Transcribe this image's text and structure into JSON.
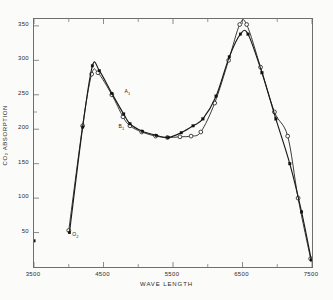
{
  "figure": {
    "background_color": "#fbfbf9",
    "frame_color": "#6e6e6e",
    "ink_color": "#1a1a1a"
  },
  "axis": {
    "y_title": "CO₂ ABSORPTION",
    "x_title": "WAVE LENGTH",
    "y_ticks": [
      350,
      300,
      250,
      200,
      150,
      100,
      50
    ],
    "x_ticks": [
      3500,
      4500,
      5500,
      6500,
      7500
    ],
    "x_minor_ticks": [
      4000,
      5000,
      6000,
      7000
    ],
    "y_minor_ticks": [
      225
    ]
  },
  "annotations": [
    {
      "name": "series-a-label",
      "text": "A",
      "sub": "1"
    },
    {
      "name": "series-b-label",
      "text": "B",
      "sub": "1"
    },
    {
      "name": "origin-marker-label",
      "text": "O",
      "sub": "2"
    }
  ],
  "chart_data": {
    "type": "line",
    "title": "",
    "xlabel": "WAVE LENGTH",
    "ylabel": "CO₂ ABSORPTION",
    "xlim": [
      3500,
      7500
    ],
    "ylim": [
      0,
      360
    ],
    "grid": false,
    "legend": "none",
    "series": [
      {
        "name": "A₁",
        "marker": "open-circle",
        "points": [
          {
            "x": 4000,
            "y": 53
          },
          {
            "x": 4200,
            "y": 205
          },
          {
            "x": 4330,
            "y": 280
          },
          {
            "x": 4420,
            "y": 282
          },
          {
            "x": 4620,
            "y": 250
          },
          {
            "x": 4780,
            "y": 218
          },
          {
            "x": 4880,
            "y": 205
          },
          {
            "x": 5050,
            "y": 196
          },
          {
            "x": 5250,
            "y": 190
          },
          {
            "x": 5420,
            "y": 188
          },
          {
            "x": 5600,
            "y": 189
          },
          {
            "x": 5760,
            "y": 190
          },
          {
            "x": 5900,
            "y": 196
          },
          {
            "x": 6100,
            "y": 238
          },
          {
            "x": 6300,
            "y": 300
          },
          {
            "x": 6460,
            "y": 352
          },
          {
            "x": 6560,
            "y": 352
          },
          {
            "x": 6760,
            "y": 290
          },
          {
            "x": 6960,
            "y": 225
          },
          {
            "x": 7150,
            "y": 190
          },
          {
            "x": 7300,
            "y": 100
          },
          {
            "x": 7480,
            "y": 12
          }
        ]
      },
      {
        "name": "B₁",
        "marker": "filled-square",
        "points": [
          {
            "x": 3500,
            "y": 38
          },
          {
            "x": 4010,
            "y": 50
          },
          {
            "x": 4200,
            "y": 203
          },
          {
            "x": 4340,
            "y": 292
          },
          {
            "x": 4440,
            "y": 285
          },
          {
            "x": 4620,
            "y": 252
          },
          {
            "x": 4790,
            "y": 222
          },
          {
            "x": 4880,
            "y": 208
          },
          {
            "x": 5060,
            "y": 197
          },
          {
            "x": 5260,
            "y": 191
          },
          {
            "x": 5430,
            "y": 188
          },
          {
            "x": 5620,
            "y": 195
          },
          {
            "x": 5790,
            "y": 205
          },
          {
            "x": 5930,
            "y": 215
          },
          {
            "x": 6120,
            "y": 248
          },
          {
            "x": 6310,
            "y": 305
          },
          {
            "x": 6470,
            "y": 338
          },
          {
            "x": 6580,
            "y": 338
          },
          {
            "x": 6780,
            "y": 282
          },
          {
            "x": 6980,
            "y": 215
          },
          {
            "x": 7180,
            "y": 150
          },
          {
            "x": 7350,
            "y": 80
          },
          {
            "x": 7490,
            "y": 10
          }
        ]
      }
    ]
  }
}
